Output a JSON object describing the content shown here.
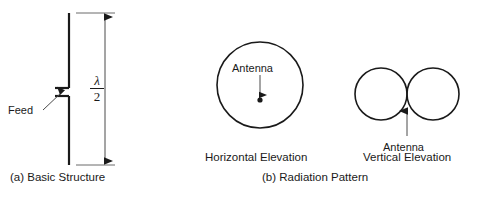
{
  "figure": {
    "background_color": "#ffffff",
    "line_color": "#1a1a1a",
    "text_color": "#1a1a1a"
  },
  "panel_a": {
    "caption": "(a) Basic Structure",
    "feed_label": "Feed",
    "dimension": {
      "numerator": "λ",
      "denominator": "2",
      "meaning": "half wavelength"
    },
    "icons": {
      "dimension_arrow": "double-headed-vertical-arrow-icon",
      "feed_leader": "leader-arrow-icon",
      "dipole": "vertical-dipole-element-icon"
    }
  },
  "panel_b": {
    "caption": "(b) Radiation Pattern",
    "plots": [
      {
        "name": "horizontal-elevation",
        "caption": "Horizontal Elevation",
        "antenna_label": "Antenna",
        "shape": "single-circle",
        "icons": {
          "pattern": "omnidirectional-circle-icon",
          "pointer": "down-arrow-icon",
          "antenna_point": "antenna-dot-icon"
        }
      },
      {
        "name": "vertical-elevation",
        "caption": "Vertical Elevation",
        "antenna_label": "Antenna",
        "shape": "two-tangent-circles",
        "icons": {
          "pattern": "figure-eight-lobes-icon",
          "pointer": "up-arrow-icon"
        }
      }
    ]
  }
}
